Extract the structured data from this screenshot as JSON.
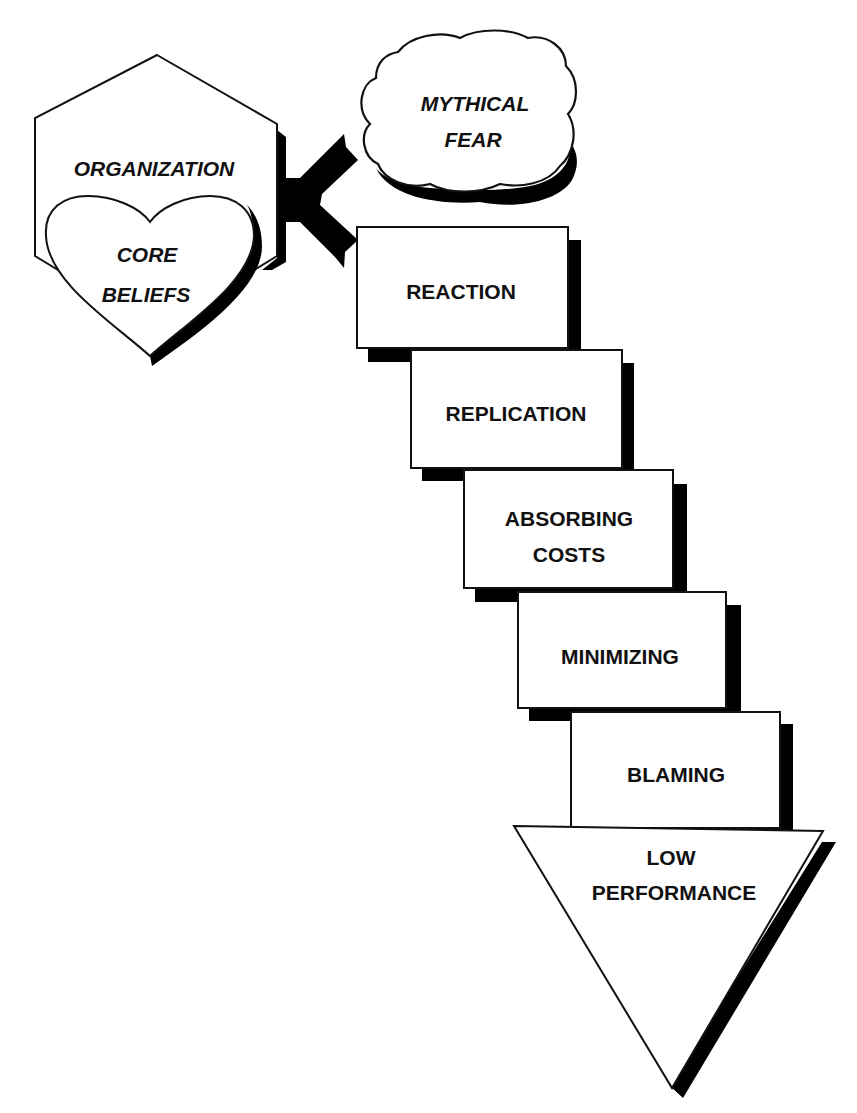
{
  "diagram": {
    "colors": {
      "stroke": "#111111",
      "shadow": "#000000",
      "fill": "#ffffff",
      "text": "#111111"
    },
    "source": {
      "organization": {
        "label": "ORGANIZATION",
        "shape": "hexagon"
      },
      "core_beliefs": {
        "line1": "CORE",
        "line2": "BELIEFS",
        "shape": "heart"
      }
    },
    "connector": {
      "shape": "forked-arrow",
      "targets": [
        "mythical_fear",
        "reaction"
      ]
    },
    "mythical_fear": {
      "line1": "MYTHICAL",
      "line2": "FEAR",
      "shape": "cloud"
    },
    "steps": [
      {
        "line1": "REACTION",
        "line2": ""
      },
      {
        "line1": "REPLICATION",
        "line2": ""
      },
      {
        "line1": "ABSORBING",
        "line2": "COSTS"
      },
      {
        "line1": "MINIMIZING",
        "line2": ""
      },
      {
        "line1": "BLAMING",
        "line2": ""
      }
    ],
    "outcome": {
      "line1": "LOW",
      "line2": "PERFORMANCE",
      "shape": "down-triangle"
    }
  }
}
